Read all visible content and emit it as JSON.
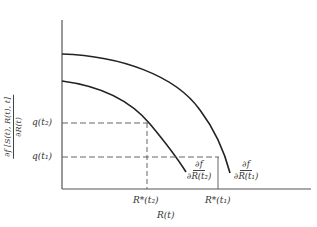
{
  "diagram": {
    "y_axis_label": {
      "numerator": "∂f [S(t), R(t), t]",
      "denominator": "∂R(t)"
    },
    "x_axis_label": "R(t)",
    "y_ticks": [
      {
        "label": "q(t₂)",
        "y": 123
      },
      {
        "label": "q(t₁)",
        "y": 157
      }
    ],
    "x_ticks": [
      {
        "label": "R*(t₂)",
        "x": 147
      },
      {
        "label": "R*(t₁)",
        "x": 218
      }
    ],
    "curve_labels": [
      {
        "numerator": "∂f",
        "denominator": "∂R(t₂)"
      },
      {
        "numerator": "∂f",
        "denominator": "∂R(t₁)"
      }
    ],
    "colors": {
      "axis": "#444444",
      "curve": "#222222",
      "dashed": "#555555"
    }
  }
}
